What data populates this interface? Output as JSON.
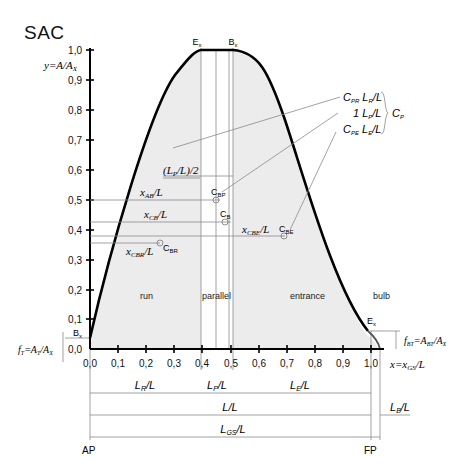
{
  "title": "SAC",
  "y_axis": {
    "label": "y=A/A",
    "label_sub": "X",
    "ticks": [
      "0,0",
      "0,1",
      "0,2",
      "0,3",
      "0,4",
      "0,5",
      "0,6",
      "0,7",
      "0,8",
      "0,9",
      "1,0"
    ]
  },
  "x_axis": {
    "label": "x=x",
    "label_sub": "GS",
    "label_tail": "/L",
    "ticks": [
      "0,0",
      "0,1",
      "0,2",
      "0,3",
      "0,4",
      "0,5",
      "0,6",
      "0,7",
      "0,8",
      "0,9",
      "1,0"
    ]
  },
  "points": {
    "Ex": "E",
    "Ex_sub": "x",
    "Bx": "B",
    "Bx_sub": "x",
    "Bx_low": "B",
    "Bx_low_sub": "x",
    "Ex_bulb": "E",
    "Ex_bulb_sub": "x"
  },
  "regions": {
    "run": "run",
    "parallel": "parallel",
    "entrance": "entrance",
    "bulb": "bulb"
  },
  "centroids": {
    "CBP": "C",
    "CBP_sub": "BP",
    "CB": "C",
    "CB_sub": "B",
    "CBE": "C",
    "CBE_sub": "BE",
    "CBR": "C",
    "CBR_sub": "BR"
  },
  "dimensions": {
    "half_parallel": "(L",
    "half_parallel_sub": "P",
    "half_parallel_tail": "/L)/2",
    "xAB": "x",
    "xAB_sub": "AB",
    "xCB": "x",
    "xCB_sub": "CB",
    "xCBE": "x",
    "xCBE_sub": "CBE",
    "xCBR": "x",
    "xCBR_sub": "CBR",
    "LR": "L",
    "LR_sub": "R",
    "LP": "L",
    "LP_sub": "P",
    "LE": "L",
    "LE_sub": "E",
    "L": "L/L",
    "LB": "L",
    "LB_sub": "B",
    "LGS": "L",
    "LGS_sub": "GS",
    "over_L": "/L"
  },
  "coefficients": {
    "line1": "C",
    "line1_sub": "PR",
    "line1_mid": " L",
    "line1_mid_sub": "R",
    "line2": "1 L",
    "line2_sub": "P",
    "line3": "C",
    "line3_sub": "PE",
    "line3_mid": " L",
    "line3_mid_sub": "E",
    "group": "C",
    "group_sub": "P"
  },
  "fractions": {
    "fT": "f",
    "fT_sub": "T",
    "fT_eq": "=A",
    "fT_eq_sub": "T",
    "fT_tail": "/A",
    "fT_tail_sub": "X",
    "fBT": "f",
    "fBT_sub": "BT",
    "fBT_eq": "=A",
    "fBT_eq_sub": "BT",
    "fBT_tail": "/A",
    "fBT_tail_sub": "X"
  },
  "ends": {
    "ap": "AP",
    "fp": "FP"
  },
  "colors": {
    "fill": "#ececec",
    "curve": "#000000",
    "guide": "#8a8a8a"
  }
}
